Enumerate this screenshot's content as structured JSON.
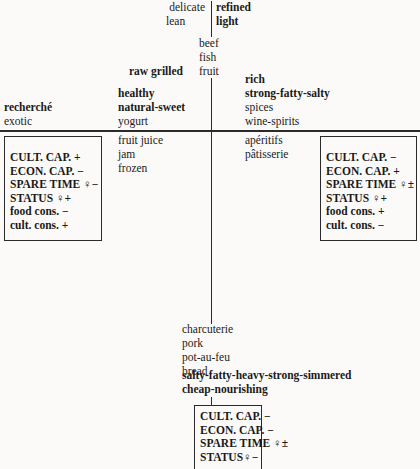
{
  "top": {
    "left": [
      "delicate",
      "lean"
    ],
    "right": [
      "refined",
      "light"
    ]
  },
  "center_top": [
    "beef",
    "fish",
    "fruit"
  ],
  "raw_grilled": "raw grilled",
  "upper_left_center": [
    "healthy",
    "natural-sweet",
    "yogurt"
  ],
  "upper_left_center_bold": [
    false,
    true,
    false
  ],
  "upper_far_left": [
    "recherché",
    "exotic"
  ],
  "upper_right": [
    "rich",
    "strong-fatty-salty",
    "spices",
    "wine-spirits"
  ],
  "upper_right_bold": [
    false,
    true,
    false,
    false
  ],
  "lower_left_center": [
    "fruit juice",
    "jam",
    "frozen"
  ],
  "lower_right_center": [
    "apéritifs",
    "pâtisserie"
  ],
  "bottom_center": [
    "charcuterie",
    "pork",
    "pot-au-feu",
    "bread",
    "salty-fatty-heavy-strong-simmered",
    "cheap-nourishing"
  ],
  "bottom_center_bold": [
    false,
    false,
    false,
    false,
    true,
    true
  ],
  "left_box": {
    "rows": [
      "CULT. CAP.  +",
      "ECON. CAP.  −",
      "SPARE TIME ♀−",
      "STATUS ♀+",
      "food cons.  −",
      "cult. cons.  +"
    ],
    "bold": [
      true,
      true,
      true,
      true,
      true,
      true
    ]
  },
  "right_box": {
    "rows": [
      "CULT. CAP.  −",
      "ECON. CAP.  +",
      "SPARE TIME ♀±",
      "STATUS ♀+",
      "food cons.  +",
      "cult. cons.  −"
    ],
    "bold": [
      true,
      true,
      true,
      true,
      true,
      true
    ]
  },
  "bottom_box": {
    "rows": [
      "CULT. CAP.  −",
      "ECON. CAP.  −",
      "SPARE TIME ♀±",
      "STATUS♀−"
    ],
    "bold": [
      true,
      true,
      true,
      true
    ]
  }
}
